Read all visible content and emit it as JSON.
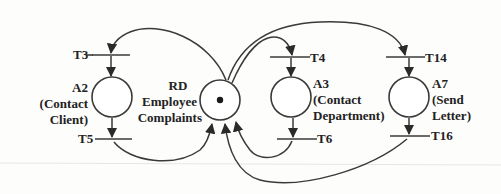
{
  "diagram": {
    "type": "petri-net",
    "places": [
      {
        "id": "A2",
        "label": "A2",
        "sub1": "(Contact",
        "sub2": "Client)"
      },
      {
        "id": "RD",
        "label": "RD",
        "sub1": "Employee",
        "sub2": "Complaints",
        "tokens": 1
      },
      {
        "id": "A3",
        "label": "A3",
        "sub1": "(Contact",
        "sub2": "Department)"
      },
      {
        "id": "A7",
        "label": "A7",
        "sub1": "(Send",
        "sub2": "Letter)"
      }
    ],
    "transitions": [
      {
        "id": "T3",
        "label": "T3"
      },
      {
        "id": "T5",
        "label": "T5"
      },
      {
        "id": "T4",
        "label": "T4"
      },
      {
        "id": "T6",
        "label": "T6"
      },
      {
        "id": "T14",
        "label": "T14"
      },
      {
        "id": "T16",
        "label": "T16"
      }
    ],
    "arcs": [
      {
        "from": "RD",
        "to": "T3"
      },
      {
        "from": "T3",
        "to": "A2"
      },
      {
        "from": "A2",
        "to": "T5"
      },
      {
        "from": "T5",
        "to": "RD"
      },
      {
        "from": "RD",
        "to": "T4"
      },
      {
        "from": "T4",
        "to": "A3"
      },
      {
        "from": "A3",
        "to": "T6"
      },
      {
        "from": "T6",
        "to": "RD"
      },
      {
        "from": "RD",
        "to": "T14"
      },
      {
        "from": "T14",
        "to": "A7"
      },
      {
        "from": "A7",
        "to": "T16"
      },
      {
        "from": "T16",
        "to": "RD"
      }
    ],
    "colors": {
      "stroke": "#3a3a3a",
      "text": "#222222",
      "background": "#fdfdfc"
    }
  }
}
